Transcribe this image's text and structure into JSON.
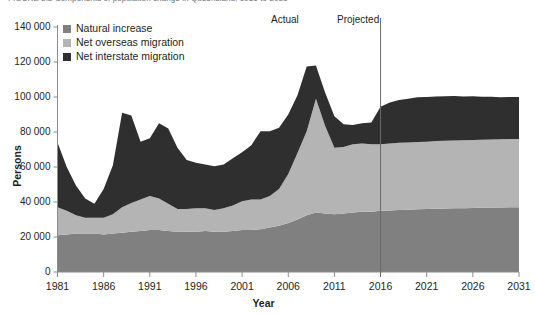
{
  "caption": "FIGURE 2.2  Components of population change in Queensland, 1981 to 2031",
  "colors": {
    "natural_increase": "#808080",
    "net_overseas_migration": "#b4b4b4",
    "net_interstate_migration": "#2f2f2f",
    "axis": "#231f20",
    "divider": "#6a6a6a",
    "background": "#ffffff"
  },
  "legend": {
    "position": "top-left",
    "items": [
      {
        "label": "Natural increase",
        "color": "#808080"
      },
      {
        "label": "Net overseas migration",
        "color": "#b4b4b4"
      },
      {
        "label": "Net interstate migration",
        "color": "#2f2f2f"
      }
    ]
  },
  "annotations": [
    {
      "name": "actual",
      "text": "Actual"
    },
    {
      "name": "projected",
      "text": "Projected"
    }
  ],
  "divider_year": 2016,
  "chart_data": {
    "type": "area",
    "stacked": true,
    "title": "Components of population change in Queensland, 1981 to 2031",
    "xlabel": "Year",
    "ylabel": "Persons",
    "xlim": [
      1981,
      2031
    ],
    "ylim": [
      0,
      140000
    ],
    "grid": false,
    "legend_position": "top-left",
    "ytick_labels": [
      "0",
      "20 000",
      "40 000",
      "60 000",
      "80 000",
      "100 000",
      "120 000",
      "140 000"
    ],
    "ytick_values": [
      0,
      20000,
      40000,
      60000,
      80000,
      100000,
      120000,
      140000
    ],
    "xtick_labels": [
      "1981",
      "1986",
      "1991",
      "1996",
      "2001",
      "2006",
      "2011",
      "2016",
      "2021",
      "2026",
      "2031"
    ],
    "xtick_values": [
      1981,
      1986,
      1991,
      1996,
      2001,
      2006,
      2011,
      2016,
      2021,
      2026,
      2031
    ],
    "x": [
      1981,
      1982,
      1983,
      1984,
      1985,
      1986,
      1987,
      1988,
      1989,
      1990,
      1991,
      1992,
      1993,
      1994,
      1995,
      1996,
      1997,
      1998,
      1999,
      2000,
      2001,
      2002,
      2003,
      2004,
      2005,
      2006,
      2007,
      2008,
      2009,
      2010,
      2011,
      2012,
      2013,
      2014,
      2015,
      2016,
      2017,
      2018,
      2019,
      2020,
      2021,
      2022,
      2023,
      2024,
      2025,
      2026,
      2027,
      2028,
      2029,
      2030,
      2031
    ],
    "series": [
      {
        "name": "Natural increase",
        "color": "#808080",
        "values": [
          21000,
          21500,
          22000,
          22000,
          22000,
          21500,
          22000,
          22500,
          23000,
          23500,
          24000,
          24000,
          23500,
          23000,
          23000,
          23000,
          23500,
          23000,
          23000,
          23500,
          24000,
          24000,
          24500,
          25500,
          26500,
          28000,
          30000,
          32500,
          34000,
          33500,
          33000,
          33500,
          34000,
          34500,
          34500,
          35000,
          35200,
          35400,
          35600,
          35800,
          36000,
          36200,
          36300,
          36400,
          36500,
          36600,
          36700,
          36800,
          36900,
          37000,
          37000
        ]
      },
      {
        "name": "Net overseas migration",
        "color": "#b4b4b4",
        "values": [
          16000,
          13500,
          10500,
          9000,
          9000,
          9500,
          11000,
          14500,
          16500,
          18000,
          19500,
          18000,
          15500,
          13000,
          13000,
          13500,
          13000,
          12500,
          13500,
          14500,
          16500,
          17500,
          17000,
          18000,
          21000,
          28000,
          38000,
          48000,
          65000,
          50000,
          38000,
          38000,
          39000,
          39000,
          38500,
          38000,
          38200,
          38400,
          38400,
          38500,
          38500,
          38600,
          38700,
          38700,
          38800,
          38800,
          38900,
          38900,
          39000,
          39000,
          39000
        ]
      },
      {
        "name": "Net interstate migration",
        "color": "#2f2f2f",
        "values": [
          37000,
          25000,
          17000,
          11000,
          8000,
          16500,
          28000,
          54000,
          50000,
          33000,
          33000,
          43000,
          43000,
          35000,
          28000,
          26000,
          25000,
          25000,
          25000,
          27000,
          28000,
          31000,
          39000,
          37000,
          35000,
          34000,
          33000,
          37000,
          19000,
          19000,
          18000,
          13000,
          11000,
          11500,
          12500,
          21500,
          23500,
          24500,
          25000,
          25500,
          25500,
          25500,
          25500,
          25500,
          25000,
          25000,
          24500,
          24500,
          24000,
          24000,
          24000
        ]
      }
    ],
    "totals_note": "Stacked totals peak near 118 000 around 2008 and flatten near 100 000 over the projection period"
  }
}
